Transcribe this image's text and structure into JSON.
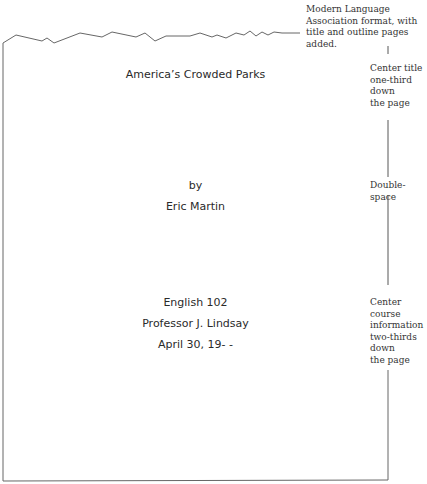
{
  "annotations": {
    "header": "Modern Language Association format, with title and outline pages added.",
    "title_note": [
      "Center title",
      "one-third",
      "down",
      "the page"
    ],
    "spacing_note": "Double-space",
    "course_note": [
      "Center",
      "course",
      "information",
      "two-thirds",
      "down",
      "the page"
    ]
  },
  "title_page": {
    "title": "America’s Crowded Parks",
    "by": "by",
    "author": "Eric Martin",
    "course": "English 102",
    "professor": "Professor J. Lindsay",
    "date": "April 30, 19- -"
  }
}
